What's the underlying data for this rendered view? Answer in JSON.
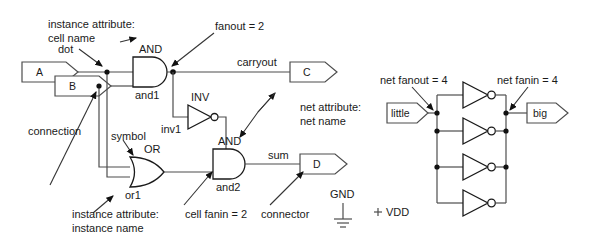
{
  "figure": {
    "background_color": "#ffffff",
    "wire_color": "#4d4d4d",
    "gate_color": "#1a1a1a",
    "text_color": "#1a1a1a"
  },
  "left_circuit": {
    "input_connectors": [
      {
        "label": "A"
      },
      {
        "label": "B"
      }
    ],
    "output_connectors": [
      {
        "label": "C"
      },
      {
        "label": "D"
      }
    ],
    "gates": [
      {
        "cell_name": "AND",
        "instance_name": "and1"
      },
      {
        "cell_name": "INV",
        "instance_name": "inv1"
      },
      {
        "cell_name": "OR",
        "instance_name": "or1"
      },
      {
        "cell_name": "AND",
        "instance_name": "and2"
      }
    ],
    "nets": [
      {
        "name": "carryout"
      },
      {
        "name": "sum"
      }
    ],
    "power_symbols": [
      {
        "label": "GND"
      },
      {
        "label": "VDD"
      }
    ]
  },
  "right_circuit": {
    "input_connector": {
      "label": "little"
    },
    "output_connector": {
      "label": "big"
    },
    "inverter_count": 4,
    "annotations": [
      {
        "text": "net fanout = 4"
      },
      {
        "text": "net fanin = 4"
      }
    ]
  },
  "annotations": {
    "instance_attribute_cell_line1": "instance attribute:",
    "instance_attribute_cell_line2": "cell name",
    "dot": "dot",
    "fanout": "fanout = 2",
    "net_attribute_line1": "net attribute:",
    "net_attribute_line2": "net name",
    "connection": "connection",
    "symbol": "symbol",
    "instance_attribute_name_line1": "instance attribute:",
    "instance_attribute_name_line2": "instance name",
    "cell_fanin": "cell fanin = 2",
    "connector": "connector"
  }
}
